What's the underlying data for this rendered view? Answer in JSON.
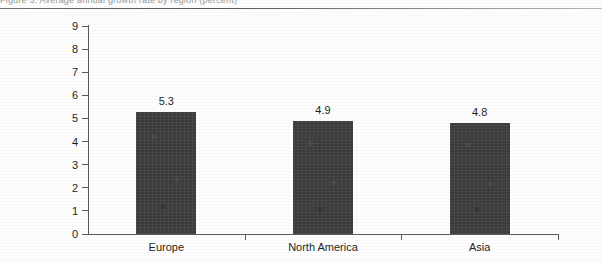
{
  "page": {
    "clipped_header_text": "Figure 3. Average annual growth rate by region (percent)",
    "background_color": "#ffffff"
  },
  "chart_data": {
    "type": "bar",
    "title": "",
    "subtitle": "",
    "xlabel": "",
    "ylabel": "",
    "categories": [
      "Europe",
      "North America",
      "Asia"
    ],
    "values": [
      5.3,
      4.9,
      4.8
    ],
    "value_labels": [
      "5.3",
      "4.9",
      "4.8"
    ],
    "ylim": [
      0,
      9
    ],
    "ytick_labels": [
      "0",
      "1",
      "2",
      "3",
      "4",
      "5",
      "6",
      "7",
      "8",
      "9"
    ],
    "ytick_values": [
      0,
      1,
      2,
      3,
      4,
      5,
      6,
      7,
      8,
      9
    ],
    "grid": false,
    "legend": null,
    "legend_position": "none",
    "series": [
      {
        "name": "",
        "values": [
          5.3,
          4.9,
          4.8
        ],
        "color": "#3b3b3b"
      }
    ],
    "bar_color": "#3b3b3b",
    "axis_color": "#5a5a5a",
    "text_color": "#1f1f1f"
  }
}
